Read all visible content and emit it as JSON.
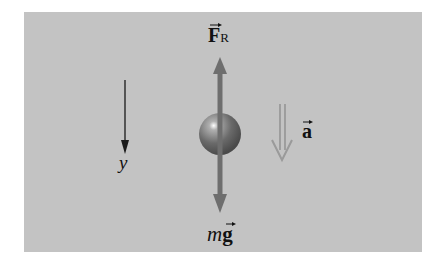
{
  "diagram": {
    "labels": {
      "force_resistance": "F",
      "force_resistance_sub": "R",
      "weight_m": "m",
      "weight_g": "g",
      "acceleration": "a",
      "axis": "y"
    },
    "colors": {
      "background": "#c3c3c3",
      "force_arrow": "#6e6e6e",
      "accel_arrow": "#9a9a9a",
      "axis_arrow": "#1a1a1a",
      "ball": "#7a7a7a"
    }
  }
}
